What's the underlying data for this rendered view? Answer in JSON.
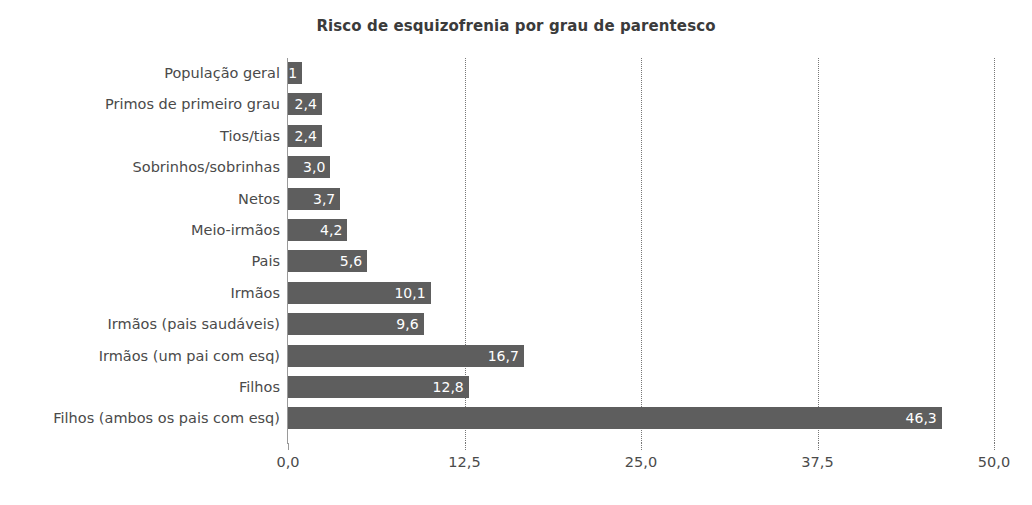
{
  "chart_data": {
    "type": "bar",
    "orientation": "horizontal",
    "title": "Risco de esquizofrenia por grau de parentesco",
    "xlabel": "",
    "ylabel": "",
    "xlim": [
      0,
      50
    ],
    "grid": true,
    "legend": false,
    "bar_color": "#5e5e5e",
    "value_label_color": "#ffffff",
    "decimal_separator": ",",
    "categories": [
      "População geral",
      "Primos de primeiro grau",
      "Tios/tias",
      "Sobrinhos/sobrinhas",
      "Netos",
      "Meio-irmãos",
      "Pais",
      "Irmãos",
      "Irmãos (pais saudáveis)",
      "Irmãos (um pai com esq)",
      "Filhos",
      "Filhos (ambos os pais com esq)"
    ],
    "values": [
      1,
      2.4,
      2.4,
      3.0,
      3.7,
      4.2,
      5.6,
      10.1,
      9.6,
      16.7,
      12.8,
      46.3
    ],
    "value_labels": [
      "1",
      "2,4",
      "2,4",
      "3,0",
      "3,7",
      "4,2",
      "5,6",
      "10,1",
      "9,6",
      "16,7",
      "12,8",
      "46,3"
    ],
    "xticks": [
      0,
      12.5,
      25,
      37.5,
      50
    ],
    "xtick_labels": [
      "0,0",
      "12,5",
      "25,0",
      "37,5",
      "50,0"
    ]
  }
}
